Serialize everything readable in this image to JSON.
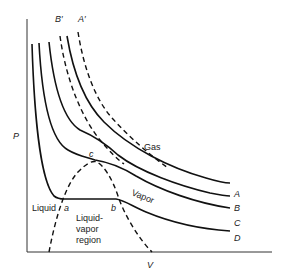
{
  "diagram": {
    "type": "P-V isotherm diagram",
    "axes": {
      "x_label": "V",
      "y_label": "P"
    },
    "isotherms": [
      {
        "id": "A",
        "label": "A",
        "style": "solid"
      },
      {
        "id": "B",
        "label": "B",
        "style": "solid"
      },
      {
        "id": "C",
        "label": "C",
        "style": "solid"
      },
      {
        "id": "D",
        "label": "D",
        "style": "solid"
      }
    ],
    "ideal_curves": [
      {
        "id": "A'",
        "label": "A′",
        "style": "dashed"
      },
      {
        "id": "B'",
        "label": "B′",
        "style": "dashed"
      }
    ],
    "points": {
      "a": "a",
      "b": "b",
      "c": "c"
    },
    "regions": {
      "gas": "Gas",
      "vapor": "Vapor",
      "liquid": "Liquid",
      "liquid_vapor_line1": "Liquid-",
      "liquid_vapor_line2": "vapor",
      "liquid_vapor_line3": "region"
    }
  }
}
